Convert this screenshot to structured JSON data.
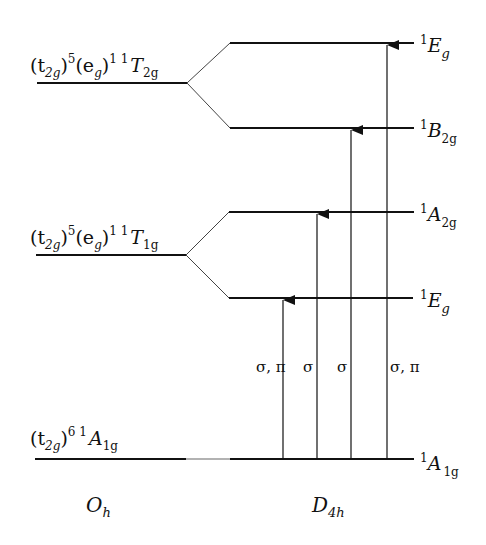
{
  "diagram": {
    "type": "energy-level correlation diagram",
    "left_column": {
      "symmetry_label": "O",
      "symmetry_sub": "h",
      "levels": [
        {
          "config": "(t2g)5(eg)1",
          "term": "1T2g",
          "y": 83
        },
        {
          "config": "(t2g)5(eg)1",
          "term": "1T1g",
          "y": 255
        },
        {
          "config": "(t2g)6",
          "term": "1A1g",
          "y": 459
        }
      ]
    },
    "right_column": {
      "symmetry_label": "D",
      "symmetry_sub": "4h",
      "levels": [
        {
          "term": "1Eg",
          "y": 43,
          "from": "1T2g"
        },
        {
          "term": "1B2g",
          "y": 128,
          "from": "1T2g"
        },
        {
          "term": "1A2g",
          "y": 212,
          "from": "1T1g"
        },
        {
          "term": "1Eg",
          "y": 298,
          "from": "1T1g"
        },
        {
          "term": "1A1g",
          "y": 459,
          "from": "1A1g"
        }
      ]
    },
    "transitions": [
      {
        "to": "1Eg (lower)",
        "polarization": "σ, π",
        "x": 283
      },
      {
        "to": "1A2g",
        "polarization": "σ",
        "x": 317
      },
      {
        "to": "1B2g",
        "polarization": "σ",
        "x": 351
      },
      {
        "to": "1Eg (upper)",
        "polarization": "σ, π",
        "x": 387
      }
    ]
  },
  "labels": {
    "oh_T2g": {
      "pre": "(t",
      "s1": "2g",
      "p1": ")",
      "e1": "5",
      "mid": "(e",
      "s2": "g",
      "p2": ")",
      "e2": "1 1",
      "T": "T",
      "Ts": "2g"
    },
    "oh_T1g": {
      "pre": "(t",
      "s1": "2g",
      "p1": ")",
      "e1": "5",
      "mid": "(e",
      "s2": "g",
      "p2": ")",
      "e2": "1 1",
      "T": "T",
      "Ts": "1g"
    },
    "oh_A1g": {
      "pre": "(t",
      "s1": "2g",
      "p1": ")",
      "e1": "6 1",
      "T": "A",
      "Ts": "1g"
    },
    "d4h_Eg_top": {
      "sup": "1",
      "main": "E",
      "sub": "g"
    },
    "d4h_B2g": {
      "sup": "1",
      "main": "B",
      "sub": "2g"
    },
    "d4h_A2g": {
      "sup": "1",
      "main": "A",
      "sub": "2g"
    },
    "d4h_Eg_low": {
      "sup": "1",
      "main": "E",
      "sub": "g"
    },
    "d4h_A1g": {
      "sup": "1",
      "main": "A",
      "sub": "1g"
    },
    "pol_1": "σ, π",
    "pol_2": "σ",
    "pol_3": "σ",
    "pol_4": "σ, π",
    "oh": {
      "main": "O",
      "sub": "h"
    },
    "d4h": {
      "main": "D",
      "sub": "4h"
    }
  },
  "colors": {
    "line": "#111111",
    "background": "#ffffff"
  }
}
